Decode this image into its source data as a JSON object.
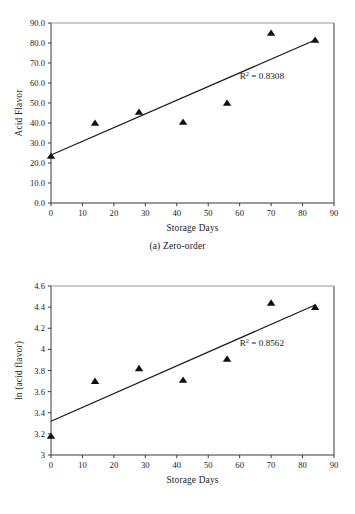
{
  "figure": {
    "background": "#ffffff",
    "marker_color": "#111111",
    "line_color": "#1a1a1a",
    "axis_color": "#3a3a3a"
  },
  "panel_a": {
    "caption": "(a) Zero-order",
    "r2_prefix": "R",
    "r2_sup": "2",
    "r2_value": " = 0.8308"
  },
  "panel_b": {
    "caption": "(b) First-order",
    "r2_prefix": "R",
    "r2_sup": "2",
    "r2_value": " = 0.8562"
  },
  "chart_data": [
    {
      "id": "a",
      "type": "scatter",
      "title": "",
      "caption": "(a) Zero-order",
      "xlabel": "Storage Days",
      "ylabel": "Acid Flavor",
      "xlim": [
        0,
        90
      ],
      "ylim": [
        0.0,
        90.0
      ],
      "xticks": [
        0,
        10,
        20,
        30,
        40,
        50,
        60,
        70,
        80,
        90
      ],
      "xticklabels": [
        "0",
        "10",
        "20",
        "30",
        "40",
        "50",
        "60",
        "70",
        "80",
        "90"
      ],
      "yticks": [
        0.0,
        10.0,
        20.0,
        30.0,
        40.0,
        50.0,
        60.0,
        70.0,
        80.0,
        90.0
      ],
      "yticklabels": [
        "0.0",
        "10.0",
        "20.0",
        "30.0",
        "40.0",
        "50.0",
        "60.0",
        "70.0",
        "80.0",
        "90.0"
      ],
      "grid": false,
      "legend": "none",
      "x": [
        0,
        14,
        28,
        42,
        56,
        70,
        84
      ],
      "y": [
        23.5,
        40.0,
        45.5,
        40.5,
        50.0,
        85.0,
        81.5
      ],
      "trendline": {
        "x": [
          0,
          84
        ],
        "y": [
          24.0,
          81.5
        ]
      },
      "annotations": [
        {
          "text": "R2 = 0.8308",
          "x": 60,
          "y": 62
        }
      ]
    },
    {
      "id": "b",
      "type": "scatter",
      "title": "",
      "caption": "(b) First-order",
      "xlabel": "Storage Days",
      "ylabel": "ln (acid flavor)",
      "xlim": [
        0,
        90
      ],
      "ylim": [
        3.0,
        4.6
      ],
      "xticks": [
        0,
        10,
        20,
        30,
        40,
        50,
        60,
        70,
        80,
        90
      ],
      "xticklabels": [
        "0",
        "10",
        "20",
        "30",
        "40",
        "50",
        "60",
        "70",
        "80",
        "90"
      ],
      "yticks": [
        3.0,
        3.2,
        3.4,
        3.6,
        3.8,
        4.0,
        4.2,
        4.4,
        4.6
      ],
      "yticklabels": [
        "3",
        "3.2",
        "3.4",
        "3.6",
        "3.8",
        "4",
        "4.2",
        "4.4",
        "4.6"
      ],
      "grid": false,
      "legend": "none",
      "x": [
        0,
        14,
        28,
        42,
        56,
        70,
        84
      ],
      "y": [
        3.18,
        3.7,
        3.82,
        3.71,
        3.91,
        4.44,
        4.4
      ],
      "trendline": {
        "x": [
          0,
          84
        ],
        "y": [
          3.32,
          4.42
        ]
      },
      "annotations": [
        {
          "text": "R2 = 0.8562",
          "x": 60,
          "y": 4.03
        }
      ]
    }
  ]
}
